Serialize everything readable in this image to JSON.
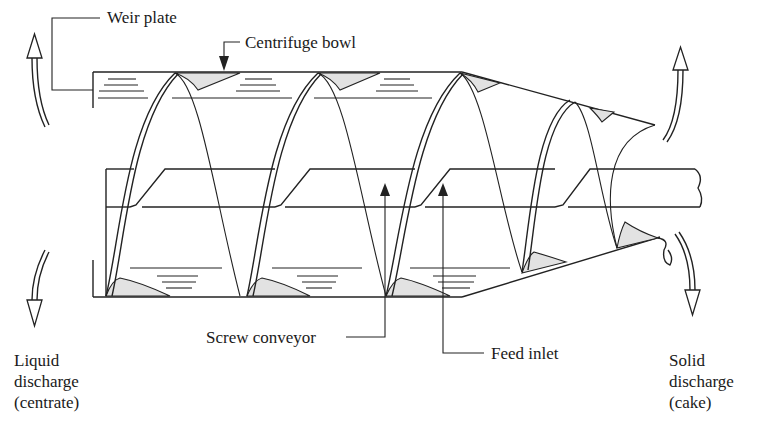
{
  "diagram": {
    "type": "decanter-centrifuge-schematic",
    "colors": {
      "line": "#222222",
      "sediment_fill": "#e2e2e2",
      "background": "#ffffff"
    },
    "labels": {
      "weir_plate": "Weir plate",
      "centrifuge_bowl": "Centrifuge bowl",
      "screw_conveyor": "Screw conveyor",
      "feed_inlet": "Feed inlet",
      "liquid_discharge": [
        "Liquid",
        "discharge",
        "(centrate)"
      ],
      "solid_discharge": [
        "Solid",
        "discharge",
        "(cake)"
      ]
    }
  }
}
